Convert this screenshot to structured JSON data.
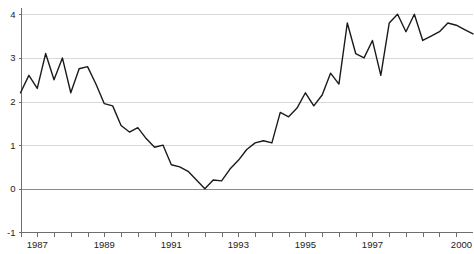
{
  "chart_data": {
    "type": "line",
    "title": "",
    "subtitle": "",
    "xlabel": "",
    "ylabel": "",
    "grid": true,
    "legend": "none",
    "xlim": [
      1986.5,
      2000.0
    ],
    "ylim": [
      -1,
      4
    ],
    "yticks": [
      4,
      3,
      2,
      1,
      0,
      -1
    ],
    "ytick_labels": [
      "4",
      "3",
      "2",
      "1",
      "0",
      "-1"
    ],
    "xtick_labels": [
      "1987",
      "1989",
      "1991",
      "1993",
      "1995",
      "1997",
      "2000"
    ],
    "xtick_values": [
      1987,
      1989,
      1991,
      1993,
      1995,
      1997,
      2000
    ],
    "minor_xticks_per_year": 2,
    "series": [
      {
        "name": "series-1",
        "color": "#1a1a1a",
        "x": [
          1986.5,
          1986.75,
          1987.0,
          1987.25,
          1987.5,
          1987.75,
          1988.0,
          1988.25,
          1988.5,
          1988.75,
          1989.0,
          1989.25,
          1989.5,
          1989.75,
          1990.0,
          1990.25,
          1990.5,
          1990.75,
          1991.0,
          1991.25,
          1991.5,
          1991.75,
          1992.0,
          1992.25,
          1992.5,
          1992.75,
          1993.0,
          1993.25,
          1993.5,
          1993.75,
          1994.0,
          1994.25,
          1994.5,
          1994.75,
          1995.0,
          1995.25,
          1995.5,
          1995.75,
          1996.0,
          1996.25,
          1996.5,
          1996.75,
          1997.0,
          1997.25,
          1997.5,
          1997.75,
          1998.0,
          1998.25,
          1998.5,
          1998.75,
          1999.0,
          1999.25,
          1999.5,
          1999.75,
          2000.0
        ],
        "y": [
          2.2,
          2.6,
          2.3,
          3.1,
          2.5,
          3.0,
          2.2,
          2.75,
          2.8,
          2.4,
          1.95,
          1.9,
          1.45,
          1.3,
          1.4,
          1.15,
          0.95,
          1.0,
          0.55,
          0.5,
          0.4,
          0.2,
          0.0,
          0.2,
          0.18,
          0.45,
          0.65,
          0.9,
          1.05,
          1.1,
          1.05,
          1.75,
          1.65,
          1.85,
          2.2,
          1.9,
          2.15,
          2.65,
          2.4,
          3.8,
          3.1,
          3.0,
          3.4,
          2.6,
          3.8,
          4.0,
          3.6,
          4.0,
          3.4,
          3.5,
          3.6,
          3.8,
          3.75,
          3.65,
          3.55
        ]
      }
    ]
  },
  "axes": {
    "y_axis_name": "value-axis",
    "x_axis_name": "year-axis"
  }
}
